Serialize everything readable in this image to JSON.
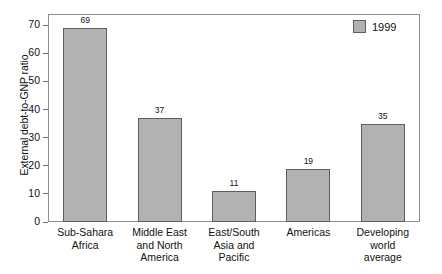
{
  "chart_data": {
    "type": "bar",
    "title": "",
    "xlabel": "",
    "ylabel": "External debt-to-GNP ratio",
    "categories": [
      "Sub-Sahara Africa",
      "Middle East and North America",
      "East/South Asia and Pacific",
      "Americas",
      "Developing world average"
    ],
    "category_lines": [
      [
        "Sub-Sahara",
        "Africa"
      ],
      [
        "Middle East",
        "and North",
        "America"
      ],
      [
        "East/South",
        "Asia and",
        "Pacific"
      ],
      [
        "Americas"
      ],
      [
        "Developing",
        "world",
        "average"
      ]
    ],
    "series": [
      {
        "name": "1999",
        "values": [
          69,
          37,
          11,
          19,
          35
        ],
        "color": "#b2b2b2"
      }
    ],
    "values": [
      69,
      37,
      11,
      19,
      35
    ],
    "data_labels": [
      "69",
      "37",
      "11",
      "19",
      "35"
    ],
    "ylim": [
      0,
      74
    ],
    "yticks": [
      0,
      10,
      20,
      30,
      40,
      50,
      60,
      70
    ],
    "ytick_labels": [
      "0",
      "10",
      "20",
      "30",
      "40",
      "50",
      "60",
      "70"
    ],
    "grid": false,
    "legend": {
      "position": "top-right",
      "entries": [
        {
          "label": "1999",
          "color": "#b2b2b2"
        }
      ]
    },
    "colors": {
      "bar_fill": "#b2b2b2",
      "bar_border": "#5e5e5e",
      "frame": "#8f8f8f",
      "text": "#111111",
      "background": "#ffffff"
    }
  }
}
